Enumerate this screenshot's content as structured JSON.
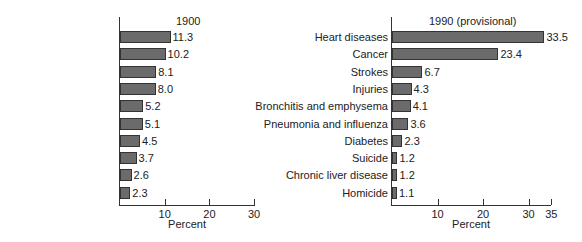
{
  "chart_data": [
    {
      "type": "bar",
      "orientation": "horizontal",
      "title": "1900",
      "xlabel": "Percent",
      "ylabel": "",
      "xlim": [
        0,
        30
      ],
      "xticks": [
        "10",
        "20",
        "30"
      ],
      "categories": [
        "Tuberculosis",
        "Pneumonia",
        "Diarrhea and enteritis",
        "Heart diseases",
        "Liver disease",
        "Injuries",
        "Strokes",
        "Cancer",
        "Bronchitis",
        "Diphtheria"
      ],
      "values": [
        11.3,
        10.2,
        8.1,
        8.0,
        5.2,
        5.1,
        4.5,
        3.7,
        2.6,
        2.3
      ],
      "value_labels": [
        "11.3",
        "10.2",
        "8.1",
        "8.0",
        "5.2",
        "5.1",
        "4.5",
        "3.7",
        "2.6",
        "2.3"
      ],
      "grid": false
    },
    {
      "type": "bar",
      "orientation": "horizontal",
      "title": "1990 (provisional)",
      "xlabel": "Percent",
      "ylabel": "",
      "xlim": [
        0,
        35
      ],
      "xticks": [
        "10",
        "20",
        "30",
        "35"
      ],
      "categories": [
        "Heart diseases",
        "Cancer",
        "Strokes",
        "Injuries",
        "Bronchitis and emphysema",
        "Pneumonia and influenza",
        "Diabetes",
        "Suicide",
        "Chronic liver disease",
        "Homicide"
      ],
      "values": [
        33.5,
        23.4,
        6.7,
        4.3,
        4.1,
        3.6,
        2.3,
        1.2,
        1.2,
        1.1
      ],
      "value_labels": [
        "33.5",
        "23.4",
        "6.7",
        "4.3",
        "4.1",
        "3.6",
        "2.3",
        "1.2",
        "1.2",
        "1.1"
      ],
      "grid": false
    }
  ],
  "colors": {
    "bar_fill": "#6b6b6b",
    "bar_border": "#333333",
    "axis": "#333333"
  }
}
